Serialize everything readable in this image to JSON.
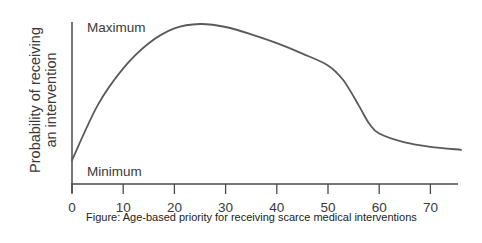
{
  "chart_data": {
    "type": "line",
    "title": "",
    "caption": "Figure: Age-based priority for receiving scarce medical interventions",
    "xlabel": "",
    "ylabel": "Probability of receiving an intervention",
    "ylabel_lines": [
      "Probability of receiving",
      "an intervention"
    ],
    "y_level_labels": {
      "max": "Maximum",
      "min": "Minimum"
    },
    "xlim": [
      0,
      76
    ],
    "ylim": [
      0,
      1
    ],
    "x_ticks": [
      0,
      10,
      20,
      30,
      40,
      50,
      60,
      70
    ],
    "x_tick_labels": [
      "0",
      "10",
      "20",
      "30",
      "40",
      "50",
      "60",
      "70"
    ],
    "grid": false,
    "legend": null,
    "series": [
      {
        "name": "Priority curve",
        "x": [
          0,
          5,
          10,
          15,
          20,
          25,
          30,
          35,
          40,
          45,
          50,
          53,
          56,
          58,
          60,
          65,
          70,
          76
        ],
        "y": [
          0.08,
          0.45,
          0.7,
          0.87,
          0.97,
          1.0,
          0.98,
          0.93,
          0.87,
          0.8,
          0.72,
          0.62,
          0.45,
          0.33,
          0.26,
          0.2,
          0.17,
          0.15
        ]
      }
    ]
  },
  "labels": {
    "ylabel_line1": "Probability of receiving",
    "ylabel_line2": "an intervention",
    "maximum": "Maximum",
    "minimum": "Minimum",
    "caption": "Figure: Age-based priority for receiving scarce medical interventions"
  },
  "colors": {
    "axis": "#4a4a4a",
    "curve": "#5a5a5a",
    "text": "#3a3a3a"
  }
}
